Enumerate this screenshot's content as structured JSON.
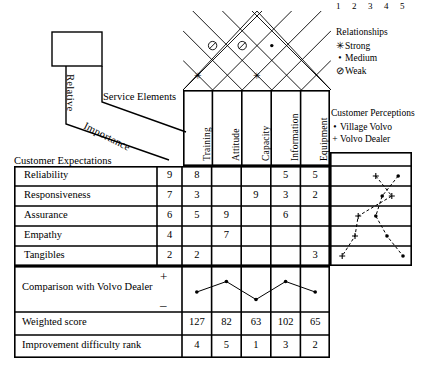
{
  "labels": {
    "relative": "Relative",
    "importance": "Importance",
    "service_elements": "Service Elements",
    "customer_expectations": "Customer Expectations",
    "comparison": "Comparison with Volvo Dealer",
    "weighted_score": "Weighted score",
    "improvement_rank": "Improvement difficulty rank",
    "plus": "+",
    "minus": "–"
  },
  "legend_relationships": {
    "title": "Relationships",
    "items": [
      {
        "symbol": "✳",
        "label": "Strong"
      },
      {
        "symbol": "•",
        "label": "Medium"
      },
      {
        "symbol": "⊘",
        "label": "Weak"
      }
    ]
  },
  "legend_perceptions": {
    "title": "Customer Perceptions",
    "items": [
      {
        "symbol": "•",
        "label": "Village Volvo"
      },
      {
        "symbol": "+",
        "label": "Volvo Dealer"
      }
    ]
  },
  "service_elements": [
    "Training",
    "Attitude",
    "Capacity",
    "Information",
    "Equipment"
  ],
  "customer_expectations": [
    "Reliability",
    "Responsiveness",
    "Assurance",
    "Empathy",
    "Tangibles"
  ],
  "relative_importance": [
    9,
    7,
    6,
    4,
    2
  ],
  "matrix": [
    [
      "8",
      "",
      "",
      "5",
      "5"
    ],
    [
      "3",
      "",
      "9",
      "3",
      "2"
    ],
    [
      "5",
      "9",
      "",
      "6",
      ""
    ],
    [
      "",
      "7",
      "",
      "",
      ""
    ],
    [
      "2",
      "",
      "",
      "",
      "3"
    ]
  ],
  "roof": {
    "rows": [
      [
        "•"
      ],
      [
        "",
        ""
      ],
      [
        "⊘",
        "⊘",
        "•"
      ],
      [
        "✳",
        "",
        "✳",
        ""
      ]
    ]
  },
  "perception_scale": [
    "1",
    "2",
    "3",
    "4",
    "5"
  ],
  "perception": {
    "village_volvo": [
      4.7,
      3.7,
      3.3,
      4.0,
      5.0
    ],
    "volvo_dealer": [
      3.3,
      4.3,
      2.2,
      2.0,
      1.2
    ]
  },
  "comparison_points": [
    2.6,
    4.0,
    1.6,
    4.0,
    2.6
  ],
  "weighted_score": [
    "127",
    "82",
    "63",
    "102",
    "65"
  ],
  "improvement_rank": [
    "4",
    "5",
    "1",
    "3",
    "2"
  ],
  "chart_data": {
    "type": "table",
    "categories": [
      "Training",
      "Attitude",
      "Capacity",
      "Information",
      "Equipment"
    ],
    "rows": [
      "Reliability",
      "Responsiveness",
      "Assurance",
      "Empathy",
      "Tangibles"
    ],
    "series": [
      {
        "name": "Relative Importance",
        "values": [
          9,
          7,
          6,
          4,
          2
        ]
      },
      {
        "name": "Weighted score",
        "values": [
          127,
          82,
          63,
          102,
          65
        ]
      },
      {
        "name": "Improvement difficulty rank",
        "values": [
          4,
          5,
          1,
          3,
          2
        ]
      },
      {
        "name": "Village Volvo perception",
        "values": [
          4.7,
          3.7,
          3.3,
          4.0,
          5.0
        ]
      },
      {
        "name": "Volvo Dealer perception",
        "values": [
          3.3,
          4.3,
          2.2,
          2.0,
          1.2
        ]
      }
    ],
    "xlabel": "Service Elements",
    "ylabel": "Customer Expectations",
    "ylim": [
      1,
      5
    ],
    "grid": true,
    "legend": "right"
  }
}
